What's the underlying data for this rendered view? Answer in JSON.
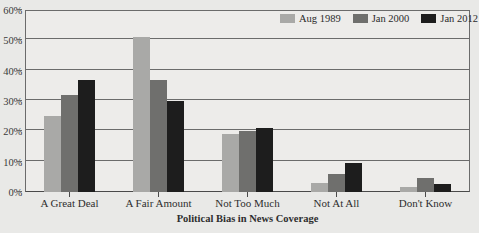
{
  "chart_data": {
    "type": "bar",
    "title": "",
    "subtitle": "",
    "xlabel": "Political Bias in News Coverage",
    "ylabel": "",
    "ylim": [
      0,
      60
    ],
    "ytick_labels": [
      "0%",
      "10%",
      "20%",
      "30%",
      "40%",
      "50%",
      "60%"
    ],
    "ytick_values": [
      0,
      10,
      20,
      30,
      40,
      50,
      60
    ],
    "grid": true,
    "legend_position": "top-right",
    "categories": [
      "A Great Deal",
      "A Fair Amount",
      "Not Too Much",
      "Not At All",
      "Don't Know"
    ],
    "series": [
      {
        "name": "Aug 1989",
        "color": "#a9a9a7",
        "values": [
          25,
          51,
          19,
          3,
          1.5
        ]
      },
      {
        "name": "Jan 2000",
        "color": "#6f6f6d",
        "values": [
          32,
          37,
          20,
          6,
          4.7
        ]
      },
      {
        "name": "Jan 2012",
        "color": "#1d1d1d",
        "values": [
          37,
          30,
          21,
          9.7,
          2.5
        ]
      }
    ]
  },
  "colors": {
    "figure_background": "#e9e9e7",
    "plot_background": "#edecea",
    "axis": "#6b6b6b",
    "gridline": "#6b6b6b",
    "text": "#2e2e2e"
  }
}
